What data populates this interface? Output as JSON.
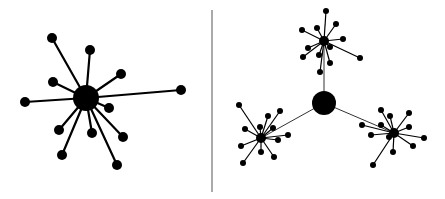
{
  "diagram": {
    "type": "network-topology-comparison",
    "colors": {
      "node": "#000000",
      "edge": "#000000",
      "divider": "#555555",
      "background": "#ffffff"
    },
    "divider": {
      "x": 212,
      "y1": 10,
      "y2": 192
    },
    "left_panel": {
      "label": "star topology",
      "hub": {
        "x": 86,
        "y": 98,
        "r": 13
      },
      "leaves": [
        {
          "x": 52,
          "y": 38
        },
        {
          "x": 90,
          "y": 50
        },
        {
          "x": 121,
          "y": 74
        },
        {
          "x": 53,
          "y": 82
        },
        {
          "x": 181,
          "y": 90
        },
        {
          "x": 25,
          "y": 102
        },
        {
          "x": 109,
          "y": 108
        },
        {
          "x": 59,
          "y": 130
        },
        {
          "x": 92,
          "y": 133
        },
        {
          "x": 123,
          "y": 137
        },
        {
          "x": 62,
          "y": 155
        },
        {
          "x": 117,
          "y": 165
        }
      ],
      "leaf_r": 5
    },
    "right_panel": {
      "label": "hierarchical star topology",
      "hub": {
        "x": 324,
        "y": 103,
        "r": 12
      },
      "sub_hubs": [
        {
          "x": 324,
          "y": 41,
          "r": 5,
          "leaves": [
            {
              "x": 326,
              "y": 11
            },
            {
              "x": 336,
              "y": 24
            },
            {
              "x": 317,
              "y": 28
            },
            {
              "x": 302,
              "y": 30
            },
            {
              "x": 343,
              "y": 39
            },
            {
              "x": 308,
              "y": 48
            },
            {
              "x": 330,
              "y": 47
            },
            {
              "x": 319,
              "y": 55
            },
            {
              "x": 303,
              "y": 57
            },
            {
              "x": 360,
              "y": 58
            },
            {
              "x": 330,
              "y": 63
            },
            {
              "x": 320,
              "y": 72
            }
          ]
        },
        {
          "x": 261,
          "y": 138,
          "r": 5,
          "leaves": [
            {
              "x": 239,
              "y": 105
            },
            {
              "x": 280,
              "y": 111
            },
            {
              "x": 268,
              "y": 116
            },
            {
              "x": 245,
              "y": 129
            },
            {
              "x": 260,
              "y": 127
            },
            {
              "x": 273,
              "y": 128
            },
            {
              "x": 288,
              "y": 135
            },
            {
              "x": 278,
              "y": 140
            },
            {
              "x": 241,
              "y": 146
            },
            {
              "x": 261,
              "y": 152
            },
            {
              "x": 274,
              "y": 157
            },
            {
              "x": 243,
              "y": 163
            }
          ]
        },
        {
          "x": 394,
          "y": 133,
          "r": 5,
          "leaves": [
            {
              "x": 381,
              "y": 110
            },
            {
              "x": 390,
              "y": 116
            },
            {
              "x": 409,
              "y": 113
            },
            {
              "x": 362,
              "y": 125
            },
            {
              "x": 381,
              "y": 125
            },
            {
              "x": 409,
              "y": 127
            },
            {
              "x": 371,
              "y": 135
            },
            {
              "x": 389,
              "y": 137
            },
            {
              "x": 424,
              "y": 138
            },
            {
              "x": 413,
              "y": 146
            },
            {
              "x": 393,
              "y": 152
            },
            {
              "x": 373,
              "y": 165
            }
          ]
        }
      ],
      "leaf_r": 3
    }
  }
}
